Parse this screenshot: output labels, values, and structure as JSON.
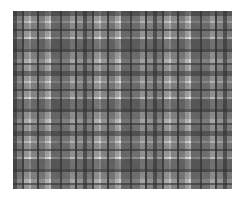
{
  "image": {
    "subject": "grayscale plaid tartan fabric texture",
    "background_color": "#ffffff",
    "pattern_bounds": {
      "left": 13,
      "top": 11,
      "width": 219,
      "height": 178
    },
    "palette": {
      "dark": "#1f1f1f",
      "mid_dark": "#5a5a5a",
      "mid": "#9a9a9a",
      "light": "#c8c8c8",
      "highlight": "#f0f0f0"
    }
  }
}
